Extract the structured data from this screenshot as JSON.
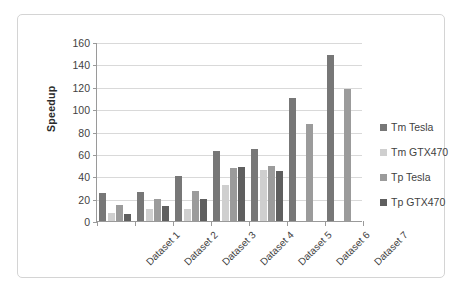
{
  "chart_data": {
    "type": "bar",
    "title": "",
    "subtitle": "",
    "xlabel": "",
    "ylabel": "Speedup",
    "ylim": [
      0,
      160
    ],
    "ytick_step": 20,
    "yticks": [
      0,
      20,
      40,
      60,
      80,
      100,
      120,
      140,
      160
    ],
    "grid": "horizontal",
    "legend_position": "right",
    "categories": [
      "Dataset 1",
      "Dataset 2",
      "Dataset 3",
      "Dataset 4",
      "Dataset 5",
      "Dataset 6",
      "Dataset 7"
    ],
    "series": [
      {
        "name": "Tm Tesla",
        "color": "#777777",
        "values": [
          25,
          26,
          40,
          63,
          64,
          110,
          148
        ]
      },
      {
        "name": "Tm GTX470",
        "color": "#cfcfcf",
        "values": [
          7,
          11,
          11,
          32,
          46,
          null,
          null
        ]
      },
      {
        "name": "Tp Tesla",
        "color": "#9b9b9b",
        "values": [
          14,
          20,
          27,
          47,
          49.5,
          87,
          118
        ]
      },
      {
        "name": "Tp GTX470",
        "color": "#5f5f5f",
        "values": [
          6,
          13,
          20,
          48,
          45,
          null,
          null
        ]
      }
    ]
  },
  "axis": {
    "y_title": "Speedup",
    "y_labels": [
      "160",
      "140",
      "120",
      "100",
      "80",
      "60",
      "40",
      "20",
      "0"
    ],
    "x_labels": [
      "Dataset 1",
      "Dataset 2",
      "Dataset 3",
      "Dataset 4",
      "Dataset 5",
      "Dataset 6",
      "Dataset 7"
    ]
  },
  "legend": {
    "items": [
      {
        "label": "Tm Tesla",
        "color": "#777777"
      },
      {
        "label": "Tm GTX470",
        "color": "#cfcfcf"
      },
      {
        "label": "Tp Tesla",
        "color": "#9b9b9b"
      },
      {
        "label": "Tp GTX470",
        "color": "#5f5f5f"
      }
    ]
  },
  "colors": {
    "frame_border": "#d4d4d4",
    "axis_line": "#9a9a9a",
    "gridline": "#d9d9d9",
    "text": "#3f3f3f",
    "background": "#ffffff"
  }
}
